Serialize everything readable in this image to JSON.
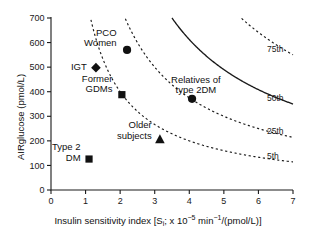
{
  "chart_data": {
    "type": "scatter",
    "title": "",
    "xlabel_parts": {
      "prefix": "Insulin sensitivity index [S",
      "sub1": "i",
      "mid": "; x 10",
      "sup1": "−5",
      "mid2": " min",
      "sup2": "−1",
      "suffix": "/(pmol/L)]"
    },
    "xlabel": "Insulin sensitivity index [Si; x 10-5 min-1/(pmol/L)]",
    "ylabel": "AIRglucose (pmol/L)",
    "xlim": [
      0,
      7
    ],
    "ylim": [
      0,
      700
    ],
    "xticks": [
      "0",
      "1",
      "2",
      "3",
      "4",
      "5",
      "6",
      "7"
    ],
    "yticks": [
      "0",
      "100",
      "200",
      "300",
      "400",
      "500",
      "600",
      "700"
    ],
    "grid": false,
    "legend_position": "inline-annotations",
    "points": [
      {
        "label": "PCO\nWomen",
        "label_line1": "PCO",
        "label_line2": "Women",
        "x": 2.2,
        "y": 570,
        "marker": "circle"
      },
      {
        "label": "IGT",
        "label_line1": "IGT",
        "label_line2": "",
        "x": 1.3,
        "y": 498,
        "marker": "diamond"
      },
      {
        "label": "Former\nGDMs",
        "label_line1": "Former",
        "label_line2": "GDMs",
        "x": 2.05,
        "y": 388,
        "marker": "square"
      },
      {
        "label": "Relatives of\ntype 2DM",
        "label_line1": "Relatives of",
        "label_line2": "type 2DM",
        "x": 4.08,
        "y": 371,
        "marker": "circle"
      },
      {
        "label": "Older\nsubjects",
        "label_line1": "Older",
        "label_line2": "subjects",
        "x": 3.15,
        "y": 206,
        "marker": "triangle"
      },
      {
        "label": "Type 2\nDM",
        "label_line1": "Type 2",
        "label_line2": "DM",
        "x": 1.1,
        "y": 126,
        "marker": "square"
      }
    ],
    "curves": [
      {
        "name": "5th",
        "style": "dashed",
        "constant": 800,
        "label": "5th"
      },
      {
        "name": "25th",
        "style": "dashed",
        "constant": 1500,
        "label": "25th"
      },
      {
        "name": "50th",
        "style": "solid",
        "constant": 2450,
        "label": "50th"
      },
      {
        "name": "75th",
        "style": "dashed",
        "constant": 3850,
        "label": "75th"
      }
    ],
    "annotations": [
      "5th",
      "25th",
      "50th",
      "75th"
    ],
    "marker_color": "#111111",
    "axis_color": "#1a1a1a"
  }
}
